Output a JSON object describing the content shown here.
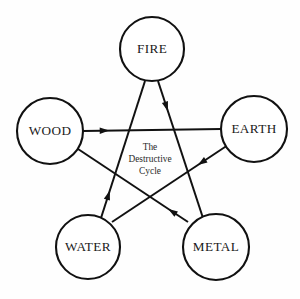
{
  "diagram": {
    "title_center": {
      "line1": "The",
      "line2": "Destructive",
      "line3": "Cycle"
    },
    "nodes": [
      {
        "id": "fire",
        "label": "FIRE",
        "cx": 152,
        "cy": 49,
        "r": 32
      },
      {
        "id": "wood",
        "label": "WOOD",
        "cx": 50,
        "cy": 131,
        "r": 33
      },
      {
        "id": "earth",
        "label": "EARTH",
        "cx": 254,
        "cy": 129,
        "r": 33
      },
      {
        "id": "water",
        "label": "WATER",
        "cx": 88,
        "cy": 247,
        "r": 32
      },
      {
        "id": "metal",
        "label": "METAL",
        "cx": 216,
        "cy": 247,
        "r": 33
      }
    ],
    "edges": [
      {
        "id": "wood-to-earth",
        "from": "WOOD",
        "to": "EARTH",
        "x1": 83,
        "y1": 131,
        "x2": 221,
        "y2": 129,
        "arrow_t": 0.19
      },
      {
        "id": "earth-to-water",
        "from": "EARTH",
        "to": "WATER",
        "x1": 228,
        "y1": 145,
        "x2": 112,
        "y2": 222,
        "arrow_t": 0.26
      },
      {
        "id": "water-to-fire",
        "from": "WATER",
        "to": "FIRE",
        "x1": 101,
        "y1": 218,
        "x2": 145,
        "y2": 81,
        "arrow_t": 0.2
      },
      {
        "id": "fire-to-metal",
        "from": "FIRE",
        "to": "METAL",
        "x1": 158,
        "y1": 81,
        "x2": 203,
        "y2": 218,
        "arrow_t": 0.22
      },
      {
        "id": "metal-to-wood",
        "from": "METAL",
        "to": "WOOD",
        "x1": 188,
        "y1": 222,
        "x2": 72,
        "y2": 145,
        "arrow_t": 0.17
      }
    ],
    "colors": {
      "stroke": "#111111",
      "fill": "#ffffff",
      "background": "#fefefe",
      "text": "#1a1a1a"
    },
    "cycle_name": "The Destructive Cycle",
    "element_order": [
      "WOOD",
      "EARTH",
      "WATER",
      "FIRE",
      "METAL"
    ]
  }
}
